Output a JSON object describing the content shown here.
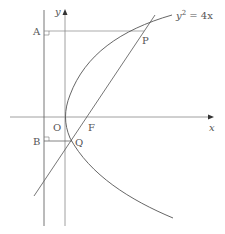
{
  "diagram": {
    "equation": "y² = 4x",
    "equation_base": "y",
    "equation_exp": "2",
    "equation_rest": " = 4x",
    "labels": {
      "x_axis": "x",
      "y_axis": "y",
      "origin": "O",
      "focus": "F",
      "point_p": "P",
      "point_q": "Q",
      "point_a": "A",
      "point_b": "B"
    },
    "colors": {
      "stroke": "#555555",
      "text": "#555555",
      "background": "#ffffff"
    }
  }
}
